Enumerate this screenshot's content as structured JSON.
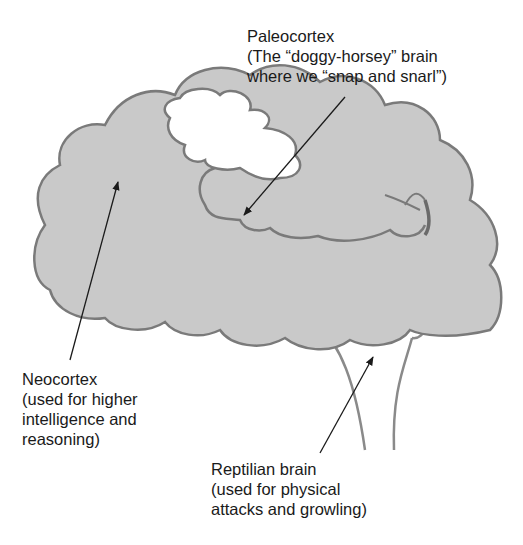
{
  "diagram": {
    "colors": {
      "neocortex_fill": "#c9c9c9",
      "outline": "#7a7a7a",
      "paleocortex_fill": "#ffffff",
      "arrow": "#1a1a1a"
    },
    "labels": {
      "paleocortex": {
        "name": "Paleocortex",
        "line1": "(The “doggy-horsey” brain",
        "line2": "where we “snap and snarl”)"
      },
      "neocortex": {
        "name": "Neocortex",
        "line1": "(used for higher",
        "line2": "intelligence and",
        "line3": "reasoning)"
      },
      "reptilian": {
        "name": "Reptilian brain",
        "line1": "(used for physical",
        "line2": "attacks and growling)"
      }
    }
  }
}
